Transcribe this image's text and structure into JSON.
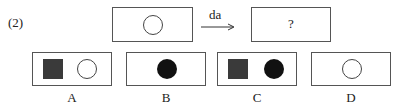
{
  "question": {
    "number_label": "(2)",
    "transform_label": "da",
    "unknown_label": "?",
    "source_figure": {
      "shapes": [
        "white-circle"
      ]
    }
  },
  "options": [
    {
      "label": "A",
      "shapes": [
        "dark-square",
        "white-circle"
      ]
    },
    {
      "label": "B",
      "shapes": [
        "black-circle"
      ]
    },
    {
      "label": "C",
      "shapes": [
        "dark-square",
        "black-circle"
      ]
    },
    {
      "label": "D",
      "shapes": [
        "white-circle"
      ]
    }
  ],
  "colors": {
    "border": "#555555",
    "dark_square": "#3a3a3a",
    "black_circle": "#111111"
  }
}
